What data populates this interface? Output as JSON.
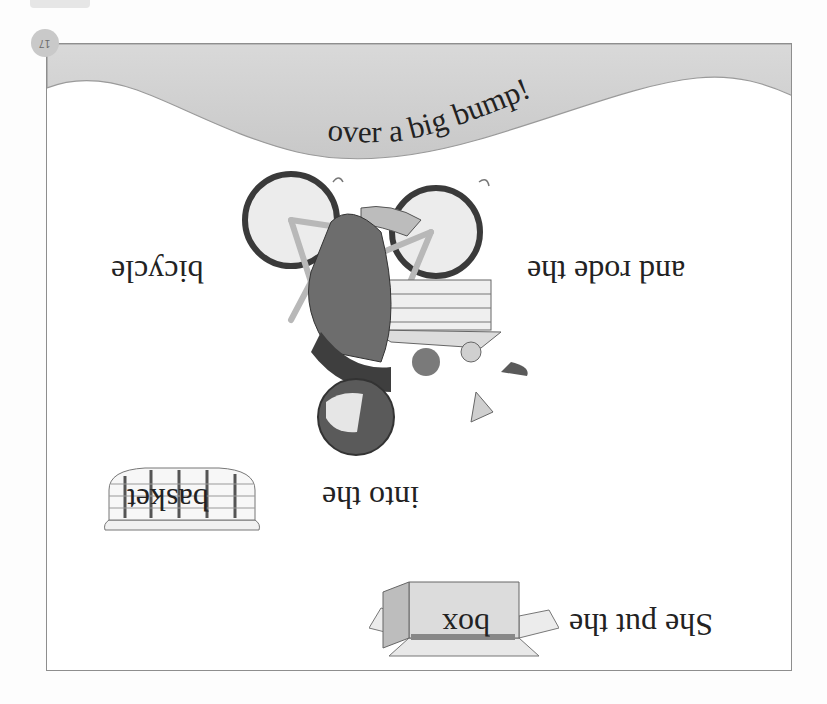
{
  "page": {
    "orientation": "rotated 180 degrees",
    "page_number": "17",
    "colors": {
      "frame_border": "#8e8e8e",
      "wave_fill": "#d4d4d4",
      "badge": "#c9c9c9",
      "text": "#222222"
    }
  },
  "story": {
    "lines": [
      {
        "text": "She put the",
        "picture_word": "box",
        "picture_icon": "box-icon"
      },
      {
        "text": "into the",
        "picture_word": "basket",
        "picture_icon": "basket-icon"
      },
      {
        "text": "and rode the",
        "picture_word": "bicycle",
        "picture_icon": "bicycle-icon"
      },
      {
        "text": "over a big bump!"
      }
    ]
  },
  "illustrations": {
    "main": "girl-falling-off-bicycle-illustration"
  }
}
